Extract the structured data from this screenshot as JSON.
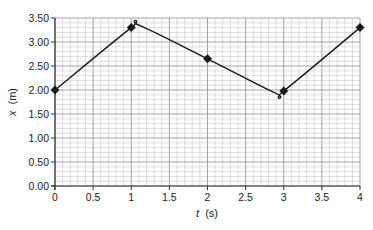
{
  "chart_data": {
    "type": "line",
    "title": "",
    "xlabel": "t (s)",
    "xlabel_var": "t",
    "xlabel_unit": "(s)",
    "ylabel": "x (m)",
    "ylabel_var": "x",
    "ylabel_unit": "(m)",
    "xlim": [
      0,
      4
    ],
    "ylim": [
      0,
      3.5
    ],
    "grid": true,
    "legend": null,
    "x_ticks": [
      "0",
      "0.5",
      "1",
      "1.5",
      "2",
      "2.5",
      "3",
      "3.5",
      "4"
    ],
    "y_ticks": [
      "0.00",
      "0.50",
      "1.00",
      "1.50",
      "2.00",
      "2.50",
      "3.00",
      "3.50"
    ],
    "series": [
      {
        "name": "position",
        "markers": "diamond",
        "x": [
          0,
          1,
          2,
          3,
          4
        ],
        "values": [
          2.0,
          3.3,
          2.65,
          1.98,
          3.3
        ]
      }
    ],
    "curve_extrema": {
      "max": {
        "t": 1.1,
        "x": 3.35
      },
      "min": {
        "t": 2.9,
        "x": 1.93
      }
    }
  },
  "colors": {
    "curve": "#1a1a1a",
    "grid_minor": "#c8c8c8",
    "grid_major": "#9a9a9a",
    "axis": "#333333"
  }
}
